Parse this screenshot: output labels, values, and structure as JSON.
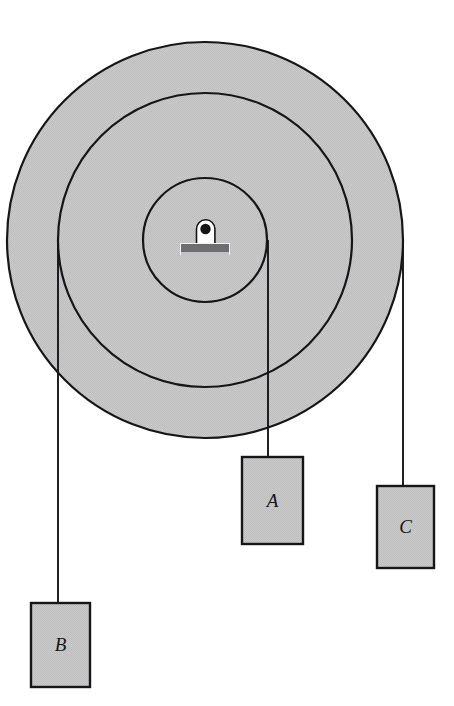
{
  "figure": {
    "type": "physics-diagram",
    "background_color": "#ffffff",
    "fill_gray": "#c6c6c6",
    "outline_color": "#16161a",
    "cord_color": "#16161a"
  },
  "pulley": {
    "name": "compound-pulley",
    "center": {
      "x": 205,
      "y": 240
    },
    "discs": [
      {
        "id": "outer",
        "radius": 198,
        "fill": "#c6c6c6",
        "stroke": "#16161a",
        "stroke_width": 2.2
      },
      {
        "id": "middle",
        "radius": 147,
        "fill": "#c6c6c6",
        "stroke": "#16161a",
        "stroke_width": 2.2
      },
      {
        "id": "inner",
        "radius": 62,
        "fill": "#c6c6c6",
        "stroke": "#16161a",
        "stroke_width": 2.2
      }
    ]
  },
  "axle": {
    "name": "axle-mount-bracket",
    "post": {
      "x": 196,
      "y": 219,
      "width": 19,
      "height": 25,
      "fill": "#ffffff",
      "stroke": "#16161a"
    },
    "hole": {
      "cx": 205.5,
      "cy": 229,
      "r": 5.2,
      "fill": "#16161a"
    },
    "base": {
      "x": 181,
      "y": 244,
      "width": 48,
      "height": 9,
      "fill": "#6e6e72"
    },
    "base_shadow": {
      "x": 181,
      "y": 251,
      "width": 48,
      "height": 4,
      "fill": "#bdbdc1"
    }
  },
  "cords": [
    {
      "id": "cord-b",
      "label": "B",
      "wraps_disc": "middle",
      "x": 58,
      "y_start": 240,
      "y_end": 603
    },
    {
      "id": "cord-a",
      "label": "A",
      "wraps_disc": "inner",
      "x": 268,
      "y_start": 240,
      "y_end": 457
    },
    {
      "id": "cord-c",
      "label": "C",
      "wraps_disc": "outer",
      "x": 403,
      "y_start": 240,
      "y_end": 486
    }
  ],
  "blocks": [
    {
      "id": "block-a",
      "label": "A",
      "x": 242,
      "y": 457,
      "width": 61,
      "height": 87,
      "fill": "#c6c6c6",
      "stroke": "#16161a"
    },
    {
      "id": "block-b",
      "label": "B",
      "x": 31,
      "y": 603,
      "width": 59,
      "height": 84,
      "fill": "#c6c6c6",
      "stroke": "#16161a"
    },
    {
      "id": "block-c",
      "label": "C",
      "x": 377,
      "y": 486,
      "width": 57,
      "height": 82,
      "fill": "#c6c6c6",
      "stroke": "#16161a"
    }
  ]
}
